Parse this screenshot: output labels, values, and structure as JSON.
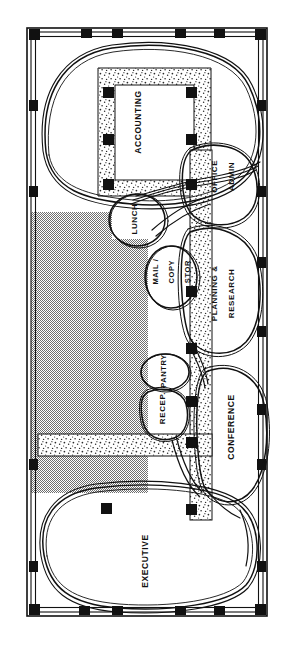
{
  "document": {
    "type": "architectural-bubble-diagram",
    "title": "Office Space Planning Bubble Diagram",
    "orientation": "portrait",
    "width_px": 291,
    "height_px": 652
  },
  "colors": {
    "ink": "#111111",
    "paper": "#ffffff",
    "shaded_fill": "#9c9c9c",
    "stipple_fill": "#ffffff",
    "column_fill": "#111111"
  },
  "legend": {
    "shaded_zone_note": "",
    "core_note": ""
  },
  "spaces": [
    {
      "id": "accounting",
      "label": "ACCOUNTING",
      "lines": [
        "ACCOUNTING"
      ],
      "rotation": -90,
      "x": 139,
      "y": 122,
      "size": 8.5
    },
    {
      "id": "office-admin",
      "label": "OFFICE ADMIN",
      "lines": [
        "OFFICE",
        "ADMIN"
      ],
      "rotation": -90,
      "x": 224,
      "y": 182,
      "size": 8.0
    },
    {
      "id": "planning",
      "label": "PLANNING & RESEARCH",
      "lines": [
        "PLANNING &",
        "RESEARCH"
      ],
      "rotation": -90,
      "x": 224,
      "y": 299,
      "size": 8.0
    },
    {
      "id": "lunch",
      "label": "LUNCH",
      "lines": [
        "LUNCH"
      ],
      "rotation": -90,
      "x": 135,
      "y": 219,
      "size": 8.0
    },
    {
      "id": "mail-copy",
      "label": "MAIL / COPY / STOR",
      "lines": [
        "MAIL /",
        "COPY",
        "STOR"
      ],
      "rotation": -90,
      "x": 172,
      "y": 277,
      "size": 7.5
    },
    {
      "id": "pantry",
      "label": "PANTRY",
      "lines": [
        "PANTRY"
      ],
      "rotation": -90,
      "x": 164,
      "y": 371,
      "size": 7.5
    },
    {
      "id": "recep",
      "label": "RECEP.",
      "lines": [
        "RECEP."
      ],
      "rotation": -90,
      "x": 163,
      "y": 408,
      "size": 8.0
    },
    {
      "id": "conference",
      "label": "CONFERENCE",
      "lines": [
        "CONFERENCE"
      ],
      "rotation": -90,
      "x": 232,
      "y": 427,
      "size": 8.5
    },
    {
      "id": "executive",
      "label": "EXECUTIVE",
      "lines": [
        "EXECUTIVE"
      ],
      "rotation": -90,
      "x": 146,
      "y": 561,
      "size": 8.5
    }
  ],
  "structure": {
    "wall_style": "double-line perimeter",
    "column_marker": "filled-square",
    "columns_top": [
      34,
      86,
      117,
      180,
      219,
      265
    ],
    "columns_bottom": [
      34,
      84,
      117,
      180,
      219,
      265
    ],
    "columns_left": [
      34,
      104,
      190,
      261,
      463,
      565
    ],
    "columns_right": [
      34,
      104,
      190,
      261,
      463,
      565
    ],
    "core_columns": [
      {
        "x": 108,
        "y": 92
      },
      {
        "x": 190,
        "y": 92
      },
      {
        "x": 108,
        "y": 140
      },
      {
        "x": 190,
        "y": 140
      },
      {
        "x": 108,
        "y": 185
      },
      {
        "x": 190,
        "y": 185
      },
      {
        "x": 190,
        "y": 292
      },
      {
        "x": 190,
        "y": 349
      },
      {
        "x": 190,
        "y": 402
      },
      {
        "x": 190,
        "y": 443
      },
      {
        "x": 190,
        "y": 508
      },
      {
        "x": 108,
        "y": 508
      }
    ]
  },
  "zones": {
    "shaded": {
      "name": "shaded-expansion-zone"
    },
    "core": {
      "name": "stippled-service-core"
    },
    "corridor": {
      "name": "stippled-corridor-spine"
    }
  }
}
